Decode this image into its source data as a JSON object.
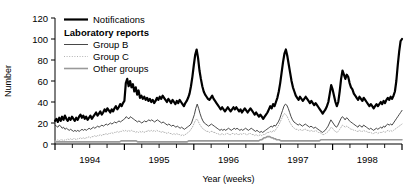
{
  "chart_data": {
    "type": "line",
    "title": "",
    "xlabel": "Year (weeks)",
    "ylabel": "Number",
    "ylim": [
      0,
      120
    ],
    "yticks": [
      0,
      20,
      40,
      60,
      80,
      100,
      120
    ],
    "ytick_labels": [
      "0",
      "20",
      "40",
      "60",
      "80",
      "100",
      "120"
    ],
    "xlim": [
      0,
      260
    ],
    "xtick_labels": [
      "1994",
      "1995",
      "1996",
      "1997",
      "1998"
    ],
    "xtick_positions": [
      26,
      78,
      130,
      182,
      234
    ],
    "minor_tick_interval_weeks": 13,
    "grid": false,
    "legend_position": "top-left-inside",
    "legend_group_heading": "Laboratory reports",
    "legend": [
      {
        "name": "Notifications",
        "style": "solid",
        "width": 2.2,
        "color": "#000000"
      },
      {
        "name": "Group B",
        "style": "solid",
        "width": 0.9,
        "color": "#333333"
      },
      {
        "name": "Group C",
        "style": "dotted",
        "width": 0.9,
        "color": "#aaaaaa"
      },
      {
        "name": "Other groups",
        "style": "solid",
        "width": 1.6,
        "color": "#999999"
      }
    ],
    "x_unit": "weeks since start of 1994",
    "series": [
      {
        "name": "Notifications",
        "color": "#000000",
        "style": "solid",
        "width": 2.2,
        "values": [
          22,
          24,
          21,
          25,
          22,
          26,
          23,
          27,
          24,
          22,
          25,
          23,
          26,
          24,
          22,
          25,
          23,
          26,
          28,
          25,
          27,
          24,
          26,
          23,
          25,
          27,
          24,
          26,
          28,
          30,
          27,
          29,
          31,
          28,
          30,
          33,
          31,
          34,
          32,
          30,
          33,
          31,
          34,
          36,
          33,
          35,
          38,
          36,
          39,
          41,
          58,
          62,
          55,
          60,
          54,
          57,
          50,
          54,
          47,
          51,
          44,
          46,
          43,
          45,
          42,
          44,
          41,
          43,
          40,
          42,
          39,
          41,
          44,
          42,
          45,
          43,
          46,
          44,
          42,
          40,
          43,
          41,
          39,
          42,
          40,
          38,
          41,
          39,
          42,
          40,
          38,
          36,
          39,
          41,
          44,
          48,
          55,
          64,
          75,
          85,
          90,
          82,
          70,
          62,
          55,
          50,
          47,
          45,
          43,
          42,
          44,
          46,
          43,
          41,
          39,
          37,
          35,
          33,
          35,
          33,
          31,
          33,
          35,
          33,
          31,
          33,
          35,
          33,
          35,
          33,
          31,
          33,
          30,
          32,
          34,
          32,
          30,
          32,
          34,
          32,
          30,
          28,
          30,
          28,
          26,
          28,
          26,
          24,
          26,
          28,
          30,
          33,
          36,
          34,
          38,
          36,
          40,
          44,
          50,
          58,
          68,
          78,
          86,
          90,
          84,
          76,
          68,
          60,
          54,
          50,
          46,
          44,
          42,
          45,
          43,
          41,
          43,
          45,
          43,
          41,
          39,
          41,
          39,
          37,
          39,
          37,
          35,
          33,
          31,
          29,
          31,
          33,
          36,
          40,
          48,
          56,
          52,
          46,
          40,
          36,
          40,
          50,
          62,
          70,
          66,
          62,
          66,
          64,
          58,
          54,
          52,
          48,
          46,
          44,
          42,
          45,
          43,
          41,
          44,
          42,
          40,
          38,
          36,
          38,
          36,
          34,
          36,
          38,
          36,
          38,
          40,
          38,
          41,
          39,
          42,
          44,
          42,
          45,
          43,
          46,
          50,
          60,
          75,
          88,
          98,
          100
        ]
      },
      {
        "name": "Group B",
        "color": "#333333",
        "style": "solid",
        "width": 0.9,
        "values": [
          18,
          17,
          16,
          18,
          17,
          15,
          16,
          14,
          15,
          14,
          13,
          14,
          13,
          12,
          13,
          12,
          13,
          12,
          13,
          14,
          13,
          14,
          13,
          14,
          15,
          14,
          15,
          16,
          15,
          16,
          17,
          16,
          17,
          18,
          17,
          18,
          19,
          18,
          19,
          20,
          19,
          20,
          21,
          20,
          21,
          22,
          21,
          22,
          23,
          24,
          26,
          25,
          24,
          26,
          25,
          24,
          23,
          22,
          21,
          22,
          21,
          20,
          21,
          22,
          21,
          22,
          23,
          22,
          23,
          22,
          21,
          22,
          23,
          22,
          21,
          20,
          21,
          20,
          19,
          18,
          19,
          18,
          17,
          18,
          17,
          16,
          17,
          16,
          15,
          16,
          15,
          14,
          15,
          16,
          17,
          18,
          20,
          24,
          28,
          34,
          38,
          34,
          29,
          25,
          22,
          20,
          19,
          18,
          17,
          18,
          19,
          18,
          17,
          16,
          15,
          14,
          13,
          14,
          13,
          14,
          13,
          14,
          15,
          14,
          13,
          14,
          15,
          14,
          15,
          14,
          13,
          14,
          13,
          14,
          15,
          14,
          13,
          14,
          15,
          14,
          13,
          12,
          13,
          12,
          11,
          12,
          11,
          12,
          13,
          14,
          15,
          16,
          17,
          16,
          18,
          17,
          19,
          21,
          24,
          28,
          32,
          36,
          38,
          37,
          34,
          30,
          26,
          23,
          21,
          20,
          19,
          18,
          19,
          18,
          17,
          18,
          19,
          18,
          17,
          16,
          17,
          16,
          15,
          16,
          15,
          14,
          13,
          12,
          11,
          12,
          13,
          15,
          17,
          20,
          23,
          21,
          19,
          17,
          16,
          18,
          21,
          24,
          26,
          25,
          23,
          25,
          24,
          22,
          21,
          20,
          19,
          18,
          17,
          16,
          18,
          17,
          16,
          18,
          17,
          16,
          15,
          14,
          15,
          14,
          13,
          14,
          15,
          14,
          15,
          16,
          15,
          17,
          16,
          18,
          19,
          18,
          19,
          18,
          20,
          22,
          24,
          26,
          28,
          30,
          32
        ]
      },
      {
        "name": "Group C",
        "color": "#aaaaaa",
        "style": "dotted",
        "width": 0.9,
        "values": [
          3,
          3,
          4,
          3,
          4,
          4,
          3,
          4,
          4,
          5,
          4,
          5,
          4,
          5,
          5,
          4,
          5,
          5,
          6,
          5,
          6,
          5,
          6,
          6,
          7,
          6,
          7,
          7,
          8,
          7,
          8,
          8,
          9,
          8,
          9,
          9,
          10,
          9,
          10,
          10,
          11,
          10,
          11,
          11,
          12,
          11,
          12,
          12,
          13,
          12,
          13,
          12,
          13,
          12,
          13,
          12,
          12,
          11,
          12,
          11,
          12,
          11,
          12,
          11,
          12,
          12,
          13,
          12,
          13,
          12,
          13,
          12,
          13,
          12,
          12,
          11,
          12,
          11,
          11,
          10,
          11,
          10,
          10,
          9,
          10,
          9,
          10,
          9,
          9,
          8,
          9,
          8,
          9,
          10,
          11,
          12,
          14,
          16,
          19,
          22,
          24,
          22,
          19,
          17,
          15,
          14,
          13,
          12,
          12,
          11,
          12,
          12,
          11,
          11,
          10,
          10,
          9,
          9,
          10,
          9,
          9,
          10,
          10,
          9,
          9,
          10,
          10,
          9,
          10,
          9,
          9,
          10,
          9,
          10,
          10,
          9,
          9,
          10,
          10,
          9,
          9,
          8,
          9,
          8,
          8,
          9,
          8,
          9,
          9,
          10,
          11,
          11,
          12,
          11,
          13,
          12,
          14,
          16,
          18,
          21,
          24,
          27,
          29,
          28,
          26,
          23,
          20,
          18,
          16,
          15,
          14,
          14,
          13,
          14,
          13,
          13,
          14,
          14,
          13,
          13,
          12,
          13,
          12,
          12,
          13,
          12,
          11,
          11,
          10,
          9,
          9,
          10,
          11,
          12,
          14,
          16,
          15,
          13,
          12,
          11,
          12,
          14,
          16,
          18,
          17,
          16,
          17,
          16,
          15,
          14,
          14,
          13,
          13,
          12,
          12,
          13,
          12,
          12,
          13,
          12,
          12,
          11,
          11,
          11,
          10,
          10,
          11,
          11,
          10,
          11,
          11,
          11,
          12,
          11,
          12,
          13,
          12,
          13,
          12,
          13,
          14,
          15,
          16,
          17,
          18,
          19
        ]
      },
      {
        "name": "Other groups",
        "color": "#999999",
        "style": "solid",
        "width": 1.6,
        "values": [
          2,
          2,
          2,
          2,
          2,
          2,
          2,
          2,
          2,
          2,
          2,
          2,
          2,
          2,
          2,
          2,
          2,
          2,
          2,
          2,
          2,
          2,
          2,
          2,
          2,
          2,
          2,
          2,
          2,
          2,
          2,
          2,
          2,
          2,
          2,
          2,
          2,
          2,
          2,
          2,
          2,
          2,
          2,
          2,
          2,
          2,
          2,
          2,
          3,
          3,
          3,
          3,
          3,
          3,
          3,
          3,
          3,
          3,
          3,
          3,
          2,
          2,
          2,
          2,
          2,
          2,
          2,
          2,
          2,
          2,
          2,
          2,
          2,
          2,
          2,
          2,
          2,
          2,
          2,
          2,
          2,
          2,
          2,
          2,
          2,
          2,
          2,
          2,
          2,
          2,
          2,
          2,
          2,
          2,
          2,
          2,
          2,
          3,
          3,
          3,
          3,
          3,
          3,
          3,
          3,
          3,
          3,
          3,
          3,
          3,
          3,
          3,
          3,
          3,
          3,
          3,
          3,
          3,
          3,
          3,
          3,
          3,
          3,
          3,
          3,
          3,
          3,
          3,
          3,
          3,
          3,
          3,
          3,
          3,
          3,
          3,
          3,
          3,
          3,
          3,
          3,
          3,
          3,
          3,
          3,
          3,
          3,
          3,
          3,
          4,
          4,
          5,
          6,
          6,
          7,
          7,
          7,
          6,
          6,
          5,
          5,
          4,
          4,
          4,
          3,
          3,
          3,
          3,
          3,
          3,
          3,
          3,
          3,
          3,
          3,
          3,
          3,
          3,
          3,
          3,
          3,
          3,
          3,
          3,
          3,
          3,
          3,
          3,
          3,
          3,
          3,
          3,
          3,
          4,
          4,
          4,
          4,
          4,
          4,
          4,
          4,
          4,
          4,
          4,
          4,
          4,
          4,
          4,
          4,
          4,
          4,
          4,
          4,
          4,
          4,
          4,
          4,
          4,
          4,
          4,
          4,
          4,
          4,
          4,
          4,
          4,
          4,
          4,
          4,
          4,
          4,
          4,
          4,
          4,
          4,
          4,
          4,
          4,
          4,
          4,
          4,
          4,
          4,
          4,
          4,
          4,
          4,
          4,
          4,
          4,
          4,
          4,
          4
        ]
      }
    ]
  }
}
